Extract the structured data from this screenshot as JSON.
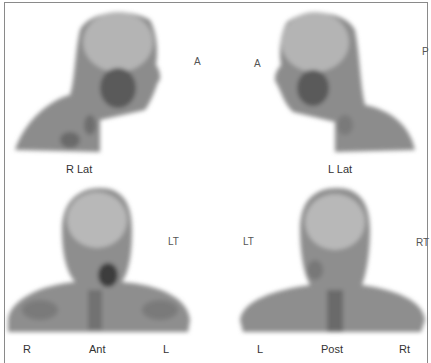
{
  "figure": {
    "panels": [
      {
        "id": "r-lat",
        "caption": "R Lat",
        "orientation_labels": [
          "A"
        ]
      },
      {
        "id": "l-lat",
        "caption": "L Lat",
        "orientation_labels": [
          "A",
          "P"
        ]
      },
      {
        "id": "ant",
        "caption": "Ant",
        "side_labels": [
          "R",
          "L"
        ],
        "orientation_labels": [
          "LT"
        ]
      },
      {
        "id": "post",
        "caption": "Post",
        "side_labels": [
          "L",
          "Rt"
        ],
        "orientation_labels": [
          "LT",
          "RT"
        ]
      }
    ]
  }
}
